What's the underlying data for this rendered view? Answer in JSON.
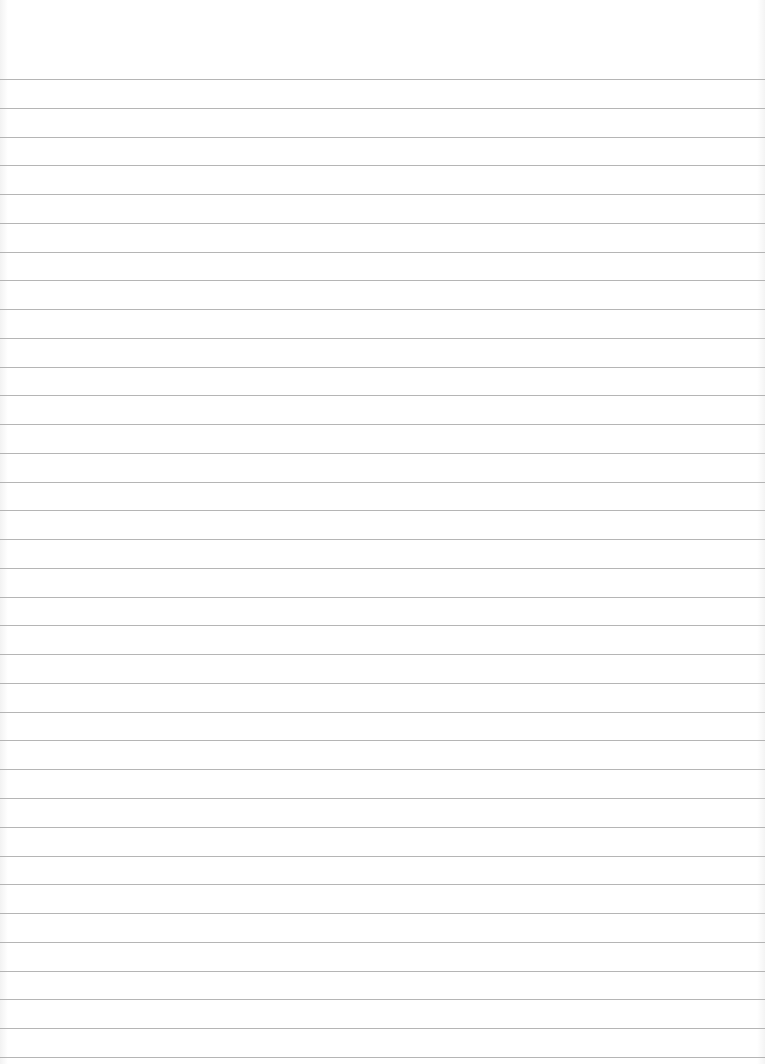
{
  "paper": {
    "type": "lined-paper",
    "background_color": "#ffffff",
    "line_color": "#a8a8a8",
    "line_count": 35,
    "first_line_y": 79,
    "line_spacing": 28.76
  }
}
